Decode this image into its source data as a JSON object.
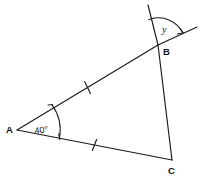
{
  "figure": {
    "background_color": "#ffffff",
    "stroke_color": "#1a1a1a"
  },
  "vertices": [
    {
      "name": "A",
      "label": "A",
      "x": 17,
      "y": 130,
      "label_x": 6,
      "label_y": 133
    },
    {
      "name": "B",
      "label": "B",
      "x": 158,
      "y": 45,
      "label_x": 163,
      "label_y": 55
    },
    {
      "name": "C",
      "label": "C",
      "x": 172,
      "y": 160,
      "label_x": 168,
      "label_y": 174
    }
  ],
  "angles": [
    {
      "at": "A",
      "label": "40°",
      "value": 40,
      "unit": "degrees",
      "label_x": 35,
      "label_y": 134,
      "marks": 1
    },
    {
      "at": "B",
      "label": "y",
      "value": null,
      "unit": "unknown",
      "label_x": 162,
      "label_y": 33,
      "type": "exterior"
    }
  ],
  "sides": [
    {
      "name": "AB",
      "from": "A",
      "to": "B",
      "tick_marks": 1
    },
    {
      "name": "AC",
      "from": "A",
      "to": "C",
      "tick_marks": 1
    },
    {
      "name": "BC",
      "from": "B",
      "to": "C",
      "tick_marks": 0
    }
  ],
  "extensions": [
    {
      "name": "AB-beyond-B",
      "from": "B",
      "to_x": 197,
      "to_y": 27
    },
    {
      "name": "CB-beyond-B",
      "from": "B",
      "to_x": 148,
      "to_y": 5
    }
  ]
}
